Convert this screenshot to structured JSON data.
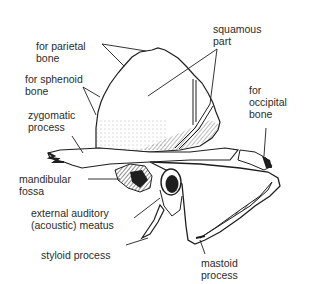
{
  "diagram": {
    "labels": {
      "parietal": "for parietal\nbone",
      "sphenoid": "for sphenoid\nbone",
      "zygomatic": "zygomatic\nprocess",
      "mandibular": "mandibular\nfossa",
      "auditory": "external auditory\n(acoustic) meatus",
      "styloid": "styloid process",
      "squamous": "squamous\npart",
      "occipital": "for\noccipital\nbone",
      "mastoid": "mastoid\nprocess"
    },
    "colors": {
      "ink": "#1e1e1e",
      "background": "#ffffff"
    }
  }
}
